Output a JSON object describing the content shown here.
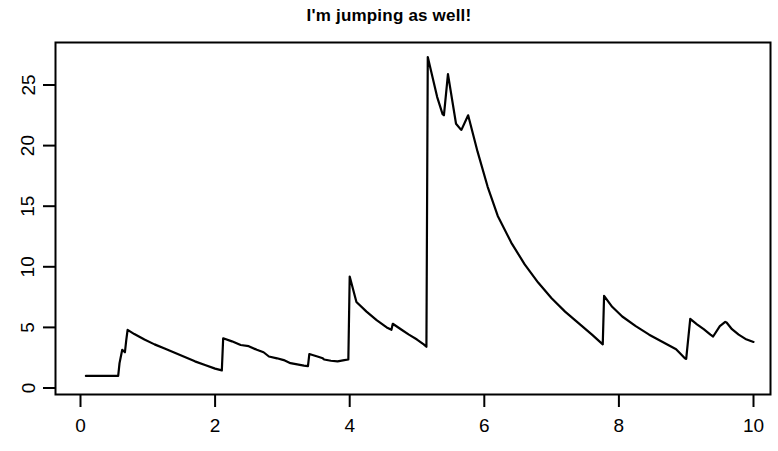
{
  "chart_data": {
    "type": "line",
    "title": "I'm jumping as well!",
    "xlabel": "",
    "ylabel": "",
    "xlim": [
      -0.08,
      10.35
    ],
    "ylim": [
      -0.2,
      28.6
    ],
    "xticks": [
      0,
      2,
      4,
      6,
      8,
      10
    ],
    "xtick_labels": [
      "0",
      "2",
      "4",
      "6",
      "8",
      "10"
    ],
    "yticks": [
      0,
      5,
      10,
      15,
      20,
      25
    ],
    "ytick_labels": [
      "0",
      "5",
      "10",
      "15",
      "20",
      "25"
    ],
    "grid": false,
    "legend": null,
    "line_color": "#000000",
    "line_width": 2.2,
    "background_color": "#ffffff",
    "axis_color": "#000000",
    "series": [
      {
        "name": "jump process",
        "x": [
          0.08,
          0.2,
          0.33,
          0.45,
          0.52,
          0.56,
          0.58,
          0.62,
          0.64,
          0.66,
          0.68,
          0.7,
          0.8,
          0.95,
          1.1,
          1.25,
          1.4,
          1.55,
          1.7,
          1.85,
          2.0,
          2.1,
          2.12,
          2.25,
          2.38,
          2.5,
          2.62,
          2.72,
          2.8,
          2.92,
          3.02,
          3.12,
          3.22,
          3.32,
          3.38,
          3.4,
          3.52,
          3.6,
          3.62,
          3.72,
          3.82,
          3.92,
          3.98,
          4.0,
          4.1,
          4.25,
          4.4,
          4.55,
          4.62,
          4.64,
          4.76,
          4.88,
          5.0,
          5.1,
          5.14,
          5.16,
          5.3,
          5.38,
          5.4,
          5.46,
          5.58,
          5.64,
          5.66,
          5.76,
          5.9,
          6.05,
          6.2,
          6.4,
          6.6,
          6.8,
          7.0,
          7.2,
          7.4,
          7.6,
          7.76,
          7.78,
          7.9,
          8.05,
          8.25,
          8.45,
          8.65,
          8.85,
          8.98,
          9.0,
          9.06,
          9.16,
          9.26,
          9.36,
          9.4,
          9.5,
          9.58,
          9.6,
          9.68,
          9.78,
          9.88,
          10.0
        ],
        "y": [
          1.0,
          1.0,
          1.0,
          1.0,
          1.0,
          1.0,
          2.05,
          3.15,
          3.05,
          2.95,
          3.95,
          4.8,
          4.45,
          4.0,
          3.6,
          3.25,
          2.9,
          2.55,
          2.2,
          1.9,
          1.6,
          1.45,
          4.1,
          3.85,
          3.55,
          3.45,
          3.15,
          2.95,
          2.6,
          2.45,
          2.3,
          2.05,
          1.95,
          1.85,
          1.8,
          2.8,
          2.6,
          2.45,
          2.35,
          2.25,
          2.2,
          2.3,
          2.35,
          9.2,
          7.1,
          6.3,
          5.6,
          5.0,
          4.8,
          5.3,
          4.85,
          4.4,
          4.0,
          3.6,
          3.4,
          27.3,
          24.0,
          22.6,
          22.5,
          25.9,
          21.8,
          21.4,
          21.3,
          22.5,
          19.5,
          16.6,
          14.2,
          12.0,
          10.2,
          8.7,
          7.4,
          6.3,
          5.35,
          4.4,
          3.6,
          7.6,
          6.7,
          5.9,
          5.1,
          4.4,
          3.8,
          3.2,
          2.45,
          2.4,
          5.7,
          5.25,
          4.85,
          4.4,
          4.25,
          5.1,
          5.45,
          5.4,
          4.85,
          4.4,
          4.05,
          3.8
        ]
      }
    ]
  }
}
